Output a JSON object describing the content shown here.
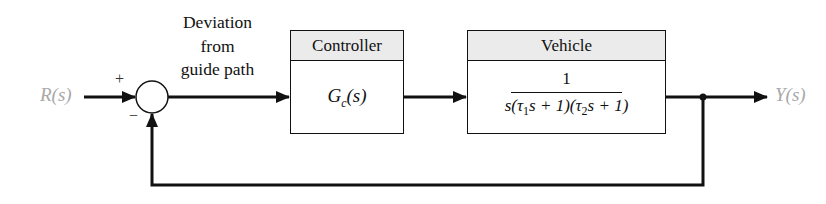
{
  "diagram": {
    "type": "feedback-control-block-diagram",
    "input": {
      "label": "R(s)"
    },
    "output": {
      "label": "Y(s)"
    },
    "summing_junction": {
      "plus_sign": "+",
      "minus_sign": "−"
    },
    "error_label": {
      "lines": [
        "Deviation",
        "from",
        "guide path"
      ]
    },
    "blocks": [
      {
        "header": "Controller",
        "transfer_function": {
          "main": "G",
          "subscript": "c",
          "arg": "(s)"
        }
      },
      {
        "header": "Vehicle",
        "transfer_function": {
          "numerator": "1",
          "denominator_parts": [
            "s(",
            "τ",
            "1",
            "s + 1)(",
            "τ",
            "2",
            "s + 1)"
          ]
        }
      }
    ],
    "feedback": "unity negative feedback from Y(s) to summing junction",
    "colors": {
      "line": "#111111",
      "header_fill": "#ebebeb",
      "signal_label": "#a8a8a8"
    }
  }
}
